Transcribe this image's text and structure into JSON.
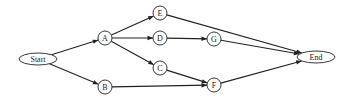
{
  "diagram": {
    "type": "directed-graph",
    "colors": {
      "stroke": "#222222",
      "fill": "#ffffff",
      "text": "#222222"
    },
    "nodes": [
      {
        "id": "Start",
        "label": "Start",
        "shape": "ellipse",
        "cx": 38,
        "cy": 59,
        "rx": 19,
        "ry": 6
      },
      {
        "id": "A",
        "label": "A",
        "shape": "circle",
        "cx": 105,
        "cy": 38,
        "r": 7
      },
      {
        "id": "B",
        "label": "B",
        "shape": "circle",
        "cx": 105,
        "cy": 87,
        "r": 7
      },
      {
        "id": "E",
        "label": "E",
        "shape": "circle",
        "cx": 160,
        "cy": 13,
        "r": 7
      },
      {
        "id": "D",
        "label": "D",
        "shape": "circle",
        "cx": 160,
        "cy": 38,
        "r": 7
      },
      {
        "id": "C",
        "label": "C",
        "shape": "circle",
        "cx": 160,
        "cy": 68,
        "r": 7
      },
      {
        "id": "G",
        "label": "G",
        "shape": "circle",
        "cx": 214,
        "cy": 39,
        "r": 7
      },
      {
        "id": "F",
        "label": "F",
        "shape": "circle",
        "cx": 214,
        "cy": 85,
        "r": 7
      },
      {
        "id": "End",
        "label": "End",
        "shape": "ellipse",
        "cx": 316,
        "cy": 57,
        "rx": 19,
        "ry": 6
      }
    ],
    "edges": [
      {
        "from": "Start",
        "to": "A"
      },
      {
        "from": "Start",
        "to": "B"
      },
      {
        "from": "A",
        "to": "E"
      },
      {
        "from": "A",
        "to": "D"
      },
      {
        "from": "A",
        "to": "C"
      },
      {
        "from": "D",
        "to": "G"
      },
      {
        "from": "C",
        "to": "F"
      },
      {
        "from": "B",
        "to": "F"
      },
      {
        "from": "E",
        "to": "End"
      },
      {
        "from": "G",
        "to": "End"
      },
      {
        "from": "F",
        "to": "End"
      }
    ]
  }
}
